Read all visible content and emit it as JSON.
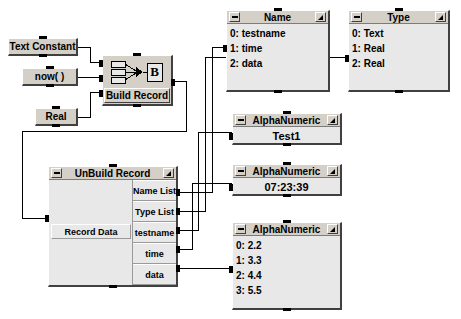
{
  "diagram": {
    "background_color": "#ffffff",
    "chrome_color": "#d4d0c8",
    "panel_color": "#e8e8e8",
    "wire_color": "#000000"
  },
  "source_nodes": [
    {
      "id": "text-constant",
      "label": "Text Constant"
    },
    {
      "id": "now",
      "label": "now( )"
    },
    {
      "id": "real",
      "label": "Real"
    }
  ],
  "build_record": {
    "label": "Build Record",
    "icon": "build-record-icon",
    "icon_letter": "B",
    "input_count": 3,
    "output_count": 1
  },
  "unbuild_record": {
    "title": "UnBuild Record",
    "input_label": "Record Data",
    "outputs": [
      {
        "label": "Name List"
      },
      {
        "label": "Type List"
      },
      {
        "label": "testname"
      },
      {
        "label": "time"
      },
      {
        "label": "data"
      }
    ]
  },
  "windows": {
    "name": {
      "title": "Name",
      "rows": [
        "0: testname",
        "1: time",
        "2: data"
      ]
    },
    "type": {
      "title": "Type",
      "rows": [
        "0: Text",
        "1: Real",
        "2: Real"
      ]
    },
    "alpha_testname": {
      "title": "AlphaNumeric",
      "value": "Test1"
    },
    "alpha_time": {
      "title": "AlphaNumeric",
      "value": "07:23:39"
    },
    "alpha_data": {
      "title": "AlphaNumeric",
      "rows": [
        "0: 2.2",
        "1: 3.3",
        "2: 4.4",
        "3: 5.5"
      ]
    }
  },
  "titlebar": {
    "minimize_icon": "minimize-icon",
    "maximize_icon": "maximize-icon"
  }
}
